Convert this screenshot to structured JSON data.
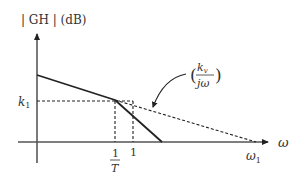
{
  "diagram": {
    "type": "bode-magnitude-asymptote",
    "y_axis_label": "| GH | (dB)",
    "x_axis_label": "ω",
    "y_tick_label": "k",
    "y_tick_subscript": "1",
    "x_ticks": [
      {
        "id": "one_over_T",
        "numerator": "1",
        "denominator": "T"
      },
      {
        "id": "one",
        "label": "1"
      },
      {
        "id": "omega1",
        "label": "ω",
        "subscript": "1"
      }
    ],
    "annotation": {
      "open_paren": "(",
      "close_paren": ")",
      "numerator": "k",
      "numerator_subscript": "v",
      "denominator": "jω"
    },
    "colors": {
      "line": "#222222",
      "axis": "#555555",
      "text": "#333333"
    }
  }
}
